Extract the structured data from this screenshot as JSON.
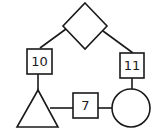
{
  "diagram": {
    "nodes": [
      {
        "id": "diamond",
        "shape": "diamond",
        "label": ""
      },
      {
        "id": "box10",
        "shape": "square",
        "label": "10"
      },
      {
        "id": "box11",
        "shape": "square",
        "label": "11"
      },
      {
        "id": "triangle",
        "shape": "triangle",
        "label": ""
      },
      {
        "id": "box7",
        "shape": "square",
        "label": "7"
      },
      {
        "id": "circle",
        "shape": "circle",
        "label": ""
      }
    ],
    "edges": [
      {
        "from": "diamond",
        "to": "box10"
      },
      {
        "from": "diamond",
        "to": "box11"
      },
      {
        "from": "box10",
        "to": "triangle"
      },
      {
        "from": "box11",
        "to": "circle"
      },
      {
        "from": "triangle",
        "to": "box7"
      },
      {
        "from": "box7",
        "to": "circle"
      }
    ],
    "colors": {
      "stroke": "#1a1a1a",
      "background": "#ffffff"
    }
  }
}
